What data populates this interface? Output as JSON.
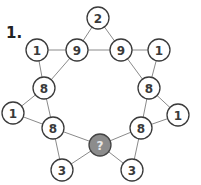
{
  "puzzle": {
    "label": "1.",
    "nodes": [
      {
        "id": "top",
        "value": "2",
        "x": 98,
        "y": 18
      },
      {
        "id": "nine-left",
        "value": "9",
        "x": 77,
        "y": 50
      },
      {
        "id": "nine-right",
        "value": "9",
        "x": 121,
        "y": 50
      },
      {
        "id": "one-top-left",
        "value": "1",
        "x": 37,
        "y": 50
      },
      {
        "id": "one-top-right",
        "value": "1",
        "x": 159,
        "y": 50
      },
      {
        "id": "eight-left-upper",
        "value": "8",
        "x": 44,
        "y": 88
      },
      {
        "id": "eight-right-upper",
        "value": "8",
        "x": 149,
        "y": 88
      },
      {
        "id": "one-left",
        "value": "1",
        "x": 13,
        "y": 113
      },
      {
        "id": "one-right",
        "value": "1",
        "x": 178,
        "y": 115
      },
      {
        "id": "eight-left-lower",
        "value": "8",
        "x": 53,
        "y": 128
      },
      {
        "id": "eight-right-lower",
        "value": "8",
        "x": 141,
        "y": 128
      },
      {
        "id": "unknown",
        "value": "?",
        "x": 100,
        "y": 145
      },
      {
        "id": "three-left",
        "value": "3",
        "x": 62,
        "y": 170
      },
      {
        "id": "three-right",
        "value": "3",
        "x": 132,
        "y": 170
      }
    ],
    "edges": [
      [
        "top",
        "nine-left"
      ],
      [
        "top",
        "nine-right"
      ],
      [
        "nine-left",
        "nine-right"
      ],
      [
        "one-top-left",
        "nine-left"
      ],
      [
        "one-top-left",
        "eight-left-upper"
      ],
      [
        "nine-left",
        "eight-left-upper"
      ],
      [
        "nine-right",
        "one-top-right"
      ],
      [
        "one-top-right",
        "eight-right-upper"
      ],
      [
        "nine-right",
        "eight-right-upper"
      ],
      [
        "eight-left-upper",
        "one-left"
      ],
      [
        "one-left",
        "eight-left-lower"
      ],
      [
        "eight-left-upper",
        "eight-left-lower"
      ],
      [
        "eight-right-upper",
        "one-right"
      ],
      [
        "one-right",
        "eight-right-lower"
      ],
      [
        "eight-right-upper",
        "eight-right-lower"
      ],
      [
        "eight-left-lower",
        "unknown"
      ],
      [
        "eight-left-lower",
        "three-left"
      ],
      [
        "three-left",
        "unknown"
      ],
      [
        "eight-right-lower",
        "unknown"
      ],
      [
        "eight-right-lower",
        "three-right"
      ],
      [
        "three-right",
        "unknown"
      ]
    ]
  }
}
